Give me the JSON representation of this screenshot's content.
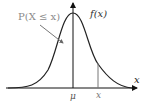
{
  "diagram": {
    "labels": {
      "cdf": "P(X ≤ x)",
      "pdf": "f(x)",
      "mean": "μ",
      "x_value": "x",
      "x_axis": "x"
    },
    "colors": {
      "curve": "#222222",
      "axis": "#111111",
      "annotation": "#8a8a8a",
      "marker_line": "#777777"
    }
  }
}
